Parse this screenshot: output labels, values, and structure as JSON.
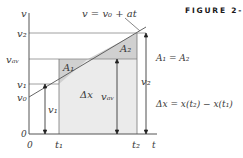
{
  "figure": {
    "label": "FIGURE 2-21",
    "line_equation": "v = v₀ + at",
    "area_equation": "A₁ = A₂",
    "displacement_equation": "Δx = x(t₂) − x(t₁)"
  },
  "axes": {
    "y_label": "v",
    "x_label": "t",
    "origin_y": "0",
    "origin_x": "0"
  },
  "y_ticks": [
    "v₂",
    "vₐᵥ",
    "v₁",
    "v₀"
  ],
  "x_ticks": [
    "t₁",
    "t₂"
  ],
  "regions": {
    "a1": "A₁",
    "a2": "A₂",
    "delta_x": "Δx"
  },
  "arrows": {
    "v1": "v₁",
    "vav": "vₐᵥ",
    "v2": "v₂"
  },
  "colors": {
    "shade_light": "#ebebeb",
    "shade_dark": "#d2d2d2",
    "line": "#555555"
  }
}
